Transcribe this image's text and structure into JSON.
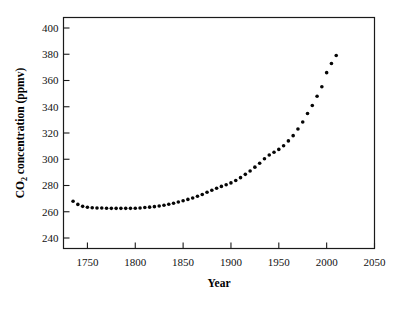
{
  "chart_data": {
    "type": "scatter",
    "title": "",
    "xlabel": "Year",
    "ylabel": "CO2 concentration (ppmv)",
    "ylabel_parts": {
      "lead": "CO",
      "subscript": "2",
      "trail": " concentration (ppmv)"
    },
    "xlim": [
      1725,
      2050
    ],
    "ylim": [
      232,
      408
    ],
    "xticks": [
      1750,
      1800,
      1850,
      1900,
      1950,
      2000,
      2050
    ],
    "xtick_labels": [
      "1750",
      "1800",
      "1850",
      "1900",
      "1950",
      "2000",
      "2050"
    ],
    "yticks": [
      240,
      260,
      280,
      300,
      320,
      340,
      360,
      380,
      400
    ],
    "ytick_labels": [
      "240",
      "260",
      "280",
      "300",
      "320",
      "340",
      "360",
      "380",
      "400"
    ],
    "grid": false,
    "legend": null,
    "marker": "filled-circle",
    "marker_color": "#050505",
    "marker_size_px": 3.6,
    "x": [
      1735,
      1740,
      1745,
      1750,
      1755,
      1760,
      1765,
      1770,
      1775,
      1780,
      1785,
      1790,
      1795,
      1800,
      1805,
      1810,
      1815,
      1820,
      1825,
      1830,
      1835,
      1840,
      1845,
      1850,
      1855,
      1860,
      1865,
      1870,
      1875,
      1880,
      1885,
      1890,
      1895,
      1900,
      1905,
      1910,
      1915,
      1920,
      1925,
      1930,
      1935,
      1940,
      1945,
      1950,
      1955,
      1960,
      1965,
      1970,
      1975,
      1980,
      1985,
      1990,
      1995,
      2000,
      2005,
      2010
    ],
    "y": [
      268.0,
      265.6,
      264.1,
      263.4,
      263.1,
      262.9,
      262.8,
      262.7,
      262.6,
      262.6,
      262.6,
      262.6,
      262.6,
      262.7,
      262.9,
      263.2,
      263.5,
      263.9,
      264.4,
      265.0,
      265.7,
      266.5,
      267.4,
      268.4,
      269.4,
      270.5,
      271.8,
      273.2,
      274.8,
      276.4,
      277.9,
      279.3,
      280.6,
      282.0,
      283.8,
      286.0,
      288.5,
      291.0,
      294.0,
      297.0,
      300.4,
      303.2,
      305.3,
      307.5,
      310.3,
      314.0,
      318.0,
      323.0,
      328.4,
      334.8,
      341.0,
      348.0,
      355.2,
      366.0,
      373.0,
      379.0,
      385.0,
      391.0,
      397.5,
      404.0,
      406.5
    ]
  },
  "chart_meta": {
    "background_color": "#ffffff",
    "axis_color": "#1a1a1a",
    "text_color": "#111111"
  }
}
